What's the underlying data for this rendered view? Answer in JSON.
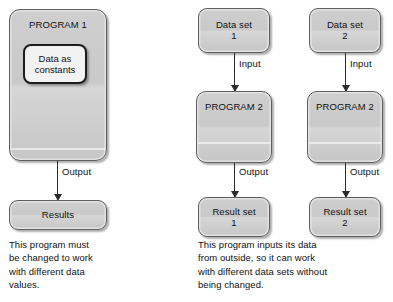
{
  "diagram": {
    "colors": {
      "box_fill_top": "#cfcfcf",
      "box_fill_bottom": "#c6c6c6",
      "box_border": "#5e5e5e",
      "inner_box_border": "#1c1c1c",
      "inner_box_fill": "#f2f2f2",
      "arrow": "#2b2b2b",
      "text": "#111111",
      "background": "#ffffff"
    },
    "left_flow": {
      "program_box": {
        "label": "PROGRAM 1"
      },
      "inner_box": {
        "label": "Data as\nconstants"
      },
      "output_arrow": {
        "label": "Output"
      },
      "result_box": {
        "label": "Results"
      },
      "caption": "This program must\nbe changed to work\nwith different data\nvalues."
    },
    "right_flows": [
      {
        "data_box": {
          "label": "Data set\n1"
        },
        "input_arrow": {
          "label": "Input"
        },
        "program_box": {
          "label": "PROGRAM 2"
        },
        "output_arrow": {
          "label": "Output"
        },
        "result_box": {
          "label": "Result set\n1"
        }
      },
      {
        "data_box": {
          "label": "Data set\n2"
        },
        "input_arrow": {
          "label": "Input"
        },
        "program_box": {
          "label": "PROGRAM 2"
        },
        "output_arrow": {
          "label": "Output"
        },
        "result_box": {
          "label": "Result set\n2"
        }
      }
    ],
    "right_caption": "This program inputs its data\nfrom outside, so it can work\nwith different data sets without\nbeing changed."
  }
}
